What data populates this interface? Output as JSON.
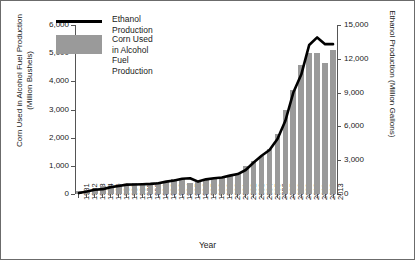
{
  "chart_data": {
    "type": "bar",
    "title": "",
    "xlabel": "Year",
    "ylabel": "Corn Used in Alcohol Fuel Production\n(Million Bushels)",
    "ylabel_right": "Ethanol Production (Million Gallons)",
    "ylim": [
      0,
      6000
    ],
    "ylim_right": [
      0,
      15000
    ],
    "yticks": [
      "0",
      "1,000",
      "2,000",
      "3,000",
      "4,000",
      "5,000",
      "6,000"
    ],
    "ytick_values": [
      0,
      1000,
      2000,
      3000,
      4000,
      5000,
      6000
    ],
    "yticks_right": [
      "0",
      "3,000",
      "6,000",
      "9,000",
      "12,000",
      "15,000"
    ],
    "ytick_values_right": [
      0,
      3000,
      6000,
      9000,
      12000,
      15000
    ],
    "grid": false,
    "legend_position": "upper-center",
    "categories": [
      "1981",
      "1982",
      "1983",
      "1984",
      "1985",
      "1986",
      "1987",
      "1988",
      "1989",
      "1990",
      "1991",
      "1992",
      "1993",
      "1994",
      "1995",
      "1996",
      "1997",
      "1998",
      "1999",
      "2000",
      "2001",
      "2002",
      "2003",
      "2004",
      "2005",
      "2006",
      "2007",
      "2008",
      "2009",
      "2010",
      "2011",
      "2012",
      "2013"
    ],
    "series": [
      {
        "name": "Corn Used in Alcohol Fuel Production",
        "type": "bar",
        "unit": "Million Bushels",
        "axis": "left",
        "color": "#9a9a9a",
        "values": [
          110,
          150,
          170,
          270,
          290,
          310,
          350,
          380,
          370,
          390,
          430,
          470,
          520,
          560,
          400,
          430,
          480,
          520,
          570,
          630,
          710,
          1000,
          1170,
          1340,
          1600,
          2120,
          3000,
          3709,
          4591,
          5019,
          5000,
          4641,
          5130
        ]
      },
      {
        "name": "Ethanol Production",
        "type": "line",
        "unit": "Million Gallons",
        "axis": "right",
        "color": "#000000",
        "values": [
          83,
          215,
          375,
          430,
          610,
          710,
          830,
          845,
          870,
          900,
          950,
          1100,
          1200,
          1350,
          1400,
          1100,
          1300,
          1400,
          1470,
          1630,
          1770,
          2130,
          2800,
          3400,
          3904,
          4884,
          6500,
          9000,
          10600,
          13230,
          13900,
          13300,
          13300
        ]
      }
    ]
  },
  "legend": {
    "line_label": "Ethanol Production",
    "bar_label": "Corn Used in Alcohol\nFuel Production"
  }
}
